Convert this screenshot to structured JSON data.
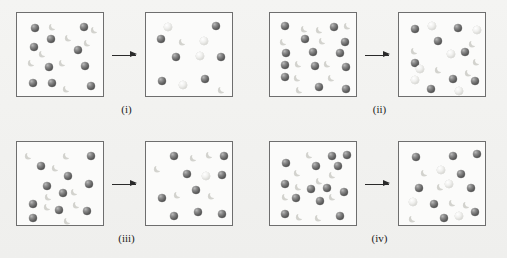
{
  "figure": {
    "type": "particle-reaction-diagram",
    "background_color": "#f2f2f0",
    "box_border_color": "#6e6e6e",
    "box_fill_color": "#fbfbfa",
    "arrow_color": "#2a2a2a",
    "species": [
      {
        "key": "dark-sphere",
        "name": "dark sphere atom",
        "color": "#5d5d5d"
      },
      {
        "key": "light-crescent",
        "name": "light crescent particle",
        "color": "#d2d2cd"
      },
      {
        "key": "light-sphere",
        "name": "light sphere atom",
        "color": "#e8e8e4"
      }
    ]
  },
  "panels": [
    {
      "id": "i",
      "label": "(i)",
      "arrow": "right-arrow",
      "reactant": {
        "caption": "reactant box",
        "counts": {
          "dark-sphere": 11,
          "light-crescent": 7,
          "light-sphere": 0
        },
        "particles": [
          {
            "t": "d",
            "x": 14,
            "y": 11,
            "r": 4.2
          },
          {
            "t": "c",
            "x": 34,
            "y": 9,
            "r": 3.6
          },
          {
            "t": "d",
            "x": 63,
            "y": 10,
            "r": 4.2
          },
          {
            "t": "c",
            "x": 76,
            "y": 12,
            "r": 3.6
          },
          {
            "t": "d",
            "x": 30,
            "y": 22,
            "r": 4.2
          },
          {
            "t": "c",
            "x": 50,
            "y": 20,
            "r": 3.6
          },
          {
            "t": "d",
            "x": 13,
            "y": 30,
            "r": 4.2
          },
          {
            "t": "d",
            "x": 57,
            "y": 33,
            "r": 4.2
          },
          {
            "t": "c",
            "x": 13,
            "y": 45,
            "r": 3.6
          },
          {
            "t": "c",
            "x": 44,
            "y": 45,
            "r": 3.6
          },
          {
            "t": "d",
            "x": 28,
            "y": 50,
            "r": 4.2
          },
          {
            "t": "d",
            "x": 64,
            "y": 49,
            "r": 4.2
          },
          {
            "t": "d",
            "x": 12,
            "y": 66,
            "r": 4.2
          },
          {
            "t": "d",
            "x": 31,
            "y": 66,
            "r": 4.2
          },
          {
            "t": "c",
            "x": 48,
            "y": 71,
            "r": 3.6
          },
          {
            "t": "d",
            "x": 70,
            "y": 69,
            "r": 4.2
          },
          {
            "t": "c",
            "x": 24,
            "y": 36,
            "r": 3.6
          },
          {
            "t": "c",
            "x": 69,
            "y": 25,
            "r": 3.6
          }
        ]
      },
      "product": {
        "caption": "product box",
        "counts": {
          "dark-sphere": 6,
          "light-crescent": 2,
          "light-sphere": 4
        },
        "particles": [
          {
            "t": "l",
            "x": 18,
            "y": 10,
            "r": 4.0
          },
          {
            "t": "d",
            "x": 66,
            "y": 9,
            "r": 4.2
          },
          {
            "t": "d",
            "x": 11,
            "y": 22,
            "r": 4.2
          },
          {
            "t": "c",
            "x": 35,
            "y": 24,
            "r": 3.6
          },
          {
            "t": "l",
            "x": 54,
            "y": 24,
            "r": 4.0
          },
          {
            "t": "d",
            "x": 26,
            "y": 40,
            "r": 4.2
          },
          {
            "t": "l",
            "x": 50,
            "y": 39,
            "r": 4.0
          },
          {
            "t": "d",
            "x": 71,
            "y": 40,
            "r": 4.2
          },
          {
            "t": "d",
            "x": 12,
            "y": 64,
            "r": 4.2
          },
          {
            "t": "l",
            "x": 33,
            "y": 68,
            "r": 4.0
          },
          {
            "t": "d",
            "x": 55,
            "y": 62,
            "r": 4.2
          },
          {
            "t": "c",
            "x": 74,
            "y": 72,
            "r": 3.6
          }
        ]
      }
    },
    {
      "id": "ii",
      "label": "(ii)",
      "arrow": "right-arrow",
      "reactant": {
        "caption": "reactant box",
        "counts": {
          "dark-sphere": 14,
          "light-crescent": 9,
          "light-sphere": 0
        },
        "particles": [
          {
            "t": "d",
            "x": 11,
            "y": 9,
            "r": 4.2
          },
          {
            "t": "c",
            "x": 33,
            "y": 11,
            "r": 3.6
          },
          {
            "t": "d",
            "x": 60,
            "y": 10,
            "r": 4.2
          },
          {
            "t": "c",
            "x": 76,
            "y": 8,
            "r": 3.6
          },
          {
            "t": "c",
            "x": 12,
            "y": 24,
            "r": 3.6
          },
          {
            "t": "d",
            "x": 31,
            "y": 22,
            "r": 4.2
          },
          {
            "t": "c",
            "x": 51,
            "y": 23,
            "r": 3.6
          },
          {
            "t": "d",
            "x": 71,
            "y": 25,
            "r": 4.2
          },
          {
            "t": "d",
            "x": 12,
            "y": 36,
            "r": 4.2
          },
          {
            "t": "d",
            "x": 39,
            "y": 35,
            "r": 4.2
          },
          {
            "t": "d",
            "x": 66,
            "y": 36,
            "r": 4.2
          },
          {
            "t": "d",
            "x": 11,
            "y": 48,
            "r": 4.2
          },
          {
            "t": "c",
            "x": 27,
            "y": 46,
            "r": 3.6
          },
          {
            "t": "d",
            "x": 41,
            "y": 49,
            "r": 4.2
          },
          {
            "t": "c",
            "x": 56,
            "y": 46,
            "r": 3.6
          },
          {
            "t": "d",
            "x": 72,
            "y": 50,
            "r": 4.2
          },
          {
            "t": "d",
            "x": 11,
            "y": 60,
            "r": 4.2
          },
          {
            "t": "c",
            "x": 26,
            "y": 60,
            "r": 3.6
          },
          {
            "t": "c",
            "x": 60,
            "y": 60,
            "r": 3.6
          },
          {
            "t": "c",
            "x": 28,
            "y": 72,
            "r": 3.6
          },
          {
            "t": "d",
            "x": 45,
            "y": 70,
            "r": 4.2
          },
          {
            "t": "d",
            "x": 72,
            "y": 72,
            "r": 4.2
          },
          {
            "t": "c",
            "x": 48,
            "y": 12,
            "r": 3.6
          }
        ]
      },
      "product": {
        "caption": "product box",
        "counts": {
          "dark-sphere": 9,
          "light-crescent": 5,
          "light-sphere": 6
        },
        "particles": [
          {
            "t": "d",
            "x": 12,
            "y": 12,
            "r": 4.2
          },
          {
            "t": "l",
            "x": 29,
            "y": 9,
            "r": 4.0
          },
          {
            "t": "d",
            "x": 55,
            "y": 11,
            "r": 4.2
          },
          {
            "t": "l",
            "x": 74,
            "y": 13,
            "r": 4.0
          },
          {
            "t": "d",
            "x": 35,
            "y": 24,
            "r": 4.2
          },
          {
            "t": "c",
            "x": 72,
            "y": 26,
            "r": 3.6
          },
          {
            "t": "c",
            "x": 14,
            "y": 33,
            "r": 3.6
          },
          {
            "t": "l",
            "x": 48,
            "y": 37,
            "r": 4.0
          },
          {
            "t": "d",
            "x": 62,
            "y": 35,
            "r": 4.2
          },
          {
            "t": "d",
            "x": 12,
            "y": 46,
            "r": 4.2
          },
          {
            "t": "c",
            "x": 76,
            "y": 44,
            "r": 3.6
          },
          {
            "t": "c",
            "x": 38,
            "y": 52,
            "r": 3.6
          },
          {
            "t": "c",
            "x": 68,
            "y": 55,
            "r": 3.6
          },
          {
            "t": "l",
            "x": 12,
            "y": 63,
            "r": 4.0
          },
          {
            "t": "d",
            "x": 50,
            "y": 62,
            "r": 4.2
          },
          {
            "t": "d",
            "x": 72,
            "y": 64,
            "r": 4.2
          },
          {
            "t": "d",
            "x": 28,
            "y": 72,
            "r": 4.2
          },
          {
            "t": "l",
            "x": 56,
            "y": 74,
            "r": 4.0
          },
          {
            "t": "l",
            "x": 17,
            "y": 52,
            "r": 4.0
          }
        ]
      }
    },
    {
      "id": "iii",
      "label": "(iii)",
      "arrow": "right-arrow",
      "reactant": {
        "caption": "reactant box",
        "counts": {
          "dark-sphere": 10,
          "light-crescent": 8,
          "light-sphere": 0
        },
        "particles": [
          {
            "t": "c",
            "x": 10,
            "y": 9,
            "r": 3.6
          },
          {
            "t": "c",
            "x": 48,
            "y": 9,
            "r": 3.6
          },
          {
            "t": "d",
            "x": 70,
            "y": 10,
            "r": 4.2
          },
          {
            "t": "d",
            "x": 20,
            "y": 20,
            "r": 4.2
          },
          {
            "t": "c",
            "x": 37,
            "y": 21,
            "r": 3.6
          },
          {
            "t": "d",
            "x": 47,
            "y": 30,
            "r": 4.2
          },
          {
            "t": "d",
            "x": 26,
            "y": 40,
            "r": 4.2
          },
          {
            "t": "d",
            "x": 68,
            "y": 38,
            "r": 4.2
          },
          {
            "t": "d",
            "x": 42,
            "y": 47,
            "r": 4.2
          },
          {
            "t": "c",
            "x": 56,
            "y": 45,
            "r": 3.6
          },
          {
            "t": "c",
            "x": 30,
            "y": 50,
            "r": 3.6
          },
          {
            "t": "d",
            "x": 12,
            "y": 58,
            "r": 4.2
          },
          {
            "t": "c",
            "x": 29,
            "y": 60,
            "r": 3.6
          },
          {
            "t": "d",
            "x": 38,
            "y": 64,
            "r": 4.2
          },
          {
            "t": "d",
            "x": 66,
            "y": 65,
            "r": 4.2
          },
          {
            "t": "d",
            "x": 12,
            "y": 72,
            "r": 4.2
          },
          {
            "t": "c",
            "x": 49,
            "y": 74,
            "r": 3.6
          },
          {
            "t": "c",
            "x": 58,
            "y": 58,
            "r": 3.6
          }
        ]
      },
      "product": {
        "caption": "product box",
        "counts": {
          "dark-sphere": 9,
          "light-crescent": 5,
          "light-sphere": 1
        },
        "particles": [
          {
            "t": "d",
            "x": 24,
            "y": 10,
            "r": 4.2
          },
          {
            "t": "c",
            "x": 46,
            "y": 11,
            "r": 3.6
          },
          {
            "t": "c",
            "x": 62,
            "y": 8,
            "r": 3.6
          },
          {
            "t": "d",
            "x": 74,
            "y": 10,
            "r": 4.2
          },
          {
            "t": "c",
            "x": 10,
            "y": 22,
            "r": 3.6
          },
          {
            "t": "d",
            "x": 37,
            "y": 28,
            "r": 4.2
          },
          {
            "t": "l",
            "x": 56,
            "y": 30,
            "r": 4.0
          },
          {
            "t": "d",
            "x": 72,
            "y": 29,
            "r": 4.2
          },
          {
            "t": "c",
            "x": 30,
            "y": 48,
            "r": 3.6
          },
          {
            "t": "d",
            "x": 46,
            "y": 44,
            "r": 4.2
          },
          {
            "t": "c",
            "x": 64,
            "y": 49,
            "r": 3.6
          },
          {
            "t": "d",
            "x": 12,
            "y": 52,
            "r": 4.2
          },
          {
            "t": "d",
            "x": 24,
            "y": 70,
            "r": 4.2
          },
          {
            "t": "d",
            "x": 48,
            "y": 66,
            "r": 4.2
          },
          {
            "t": "d",
            "x": 72,
            "y": 68,
            "r": 4.2
          }
        ]
      }
    },
    {
      "id": "iv",
      "label": "(iv)",
      "arrow": "right-arrow",
      "reactant": {
        "caption": "reactant box",
        "counts": {
          "dark-sphere": 13,
          "light-crescent": 9,
          "light-sphere": 0
        },
        "particles": [
          {
            "t": "c",
            "x": 38,
            "y": 8,
            "r": 3.6
          },
          {
            "t": "d",
            "x": 58,
            "y": 10,
            "r": 4.2
          },
          {
            "t": "d",
            "x": 73,
            "y": 9,
            "r": 4.2
          },
          {
            "t": "d",
            "x": 12,
            "y": 17,
            "r": 4.2
          },
          {
            "t": "d",
            "x": 42,
            "y": 20,
            "r": 4.2
          },
          {
            "t": "c",
            "x": 26,
            "y": 26,
            "r": 3.6
          },
          {
            "t": "c",
            "x": 61,
            "y": 28,
            "r": 3.6
          },
          {
            "t": "c",
            "x": 48,
            "y": 34,
            "r": 3.6
          },
          {
            "t": "d",
            "x": 11,
            "y": 38,
            "r": 4.2
          },
          {
            "t": "c",
            "x": 27,
            "y": 40,
            "r": 3.6
          },
          {
            "t": "d",
            "x": 37,
            "y": 43,
            "r": 4.2
          },
          {
            "t": "d",
            "x": 53,
            "y": 42,
            "r": 4.2
          },
          {
            "t": "d",
            "x": 70,
            "y": 46,
            "r": 4.2
          },
          {
            "t": "d",
            "x": 22,
            "y": 52,
            "r": 4.2
          },
          {
            "t": "d",
            "x": 46,
            "y": 55,
            "r": 4.2
          },
          {
            "t": "c",
            "x": 61,
            "y": 50,
            "r": 3.6
          },
          {
            "t": "d",
            "x": 11,
            "y": 68,
            "r": 4.2
          },
          {
            "t": "c",
            "x": 28,
            "y": 70,
            "r": 3.6
          },
          {
            "t": "c",
            "x": 47,
            "y": 71,
            "r": 3.6
          },
          {
            "t": "d",
            "x": 66,
            "y": 70,
            "r": 4.2
          },
          {
            "t": "d",
            "x": 64,
            "y": 20,
            "r": 4.2
          },
          {
            "t": "c",
            "x": 14,
            "y": 50,
            "r": 3.6
          }
        ]
      },
      "product": {
        "caption": "product box",
        "counts": {
          "dark-sphere": 9,
          "light-crescent": 5,
          "light-sphere": 4
        },
        "particles": [
          {
            "t": "d",
            "x": 13,
            "y": 11,
            "r": 4.2
          },
          {
            "t": "d",
            "x": 50,
            "y": 10,
            "r": 4.2
          },
          {
            "t": "d",
            "x": 74,
            "y": 8,
            "r": 4.2
          },
          {
            "t": "c",
            "x": 24,
            "y": 26,
            "r": 3.6
          },
          {
            "t": "l",
            "x": 38,
            "y": 24,
            "r": 4.0
          },
          {
            "t": "d",
            "x": 58,
            "y": 28,
            "r": 4.2
          },
          {
            "t": "d",
            "x": 16,
            "y": 42,
            "r": 4.2
          },
          {
            "t": "c",
            "x": 40,
            "y": 40,
            "r": 3.6
          },
          {
            "t": "d",
            "x": 68,
            "y": 42,
            "r": 4.2
          },
          {
            "t": "l",
            "x": 10,
            "y": 56,
            "r": 4.0
          },
          {
            "t": "d",
            "x": 31,
            "y": 58,
            "r": 4.2
          },
          {
            "t": "c",
            "x": 52,
            "y": 56,
            "r": 3.6
          },
          {
            "t": "c",
            "x": 66,
            "y": 58,
            "r": 3.6
          },
          {
            "t": "c",
            "x": 12,
            "y": 72,
            "r": 3.6
          },
          {
            "t": "d",
            "x": 41,
            "y": 72,
            "r": 4.2
          },
          {
            "t": "l",
            "x": 56,
            "y": 70,
            "r": 4.0
          },
          {
            "t": "d",
            "x": 72,
            "y": 66,
            "r": 4.2
          },
          {
            "t": "l",
            "x": 46,
            "y": 38,
            "r": 4.0
          }
        ]
      }
    }
  ]
}
